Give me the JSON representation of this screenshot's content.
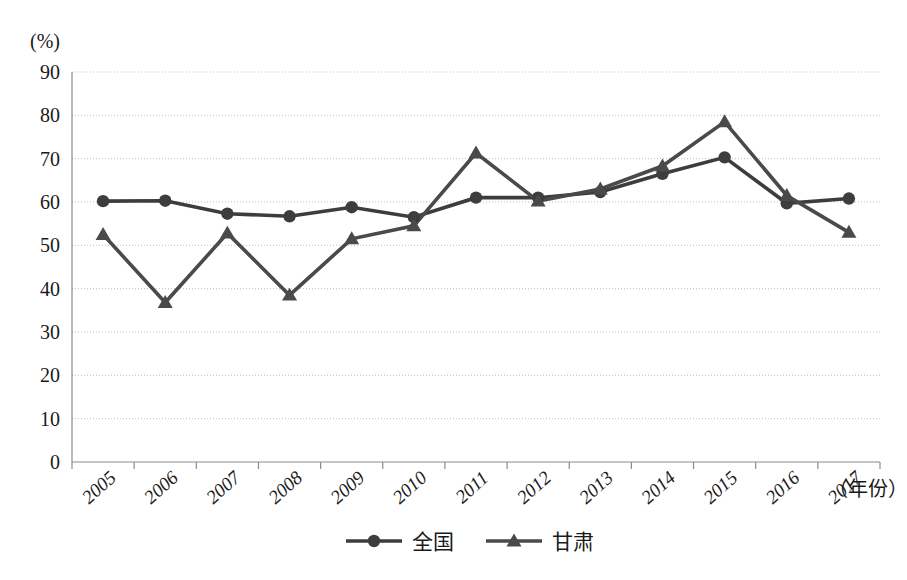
{
  "chart_data": {
    "type": "line",
    "title": "",
    "subtitle": "",
    "xlabel": "（年份）",
    "ylabel": "(%)",
    "ylim": [
      0,
      90
    ],
    "ytick_step": 10,
    "yticks": [
      "0",
      "10",
      "20",
      "30",
      "40",
      "50",
      "60",
      "70",
      "80",
      "90"
    ],
    "grid": true,
    "legend_position": "bottom-center",
    "categories": [
      "2005",
      "2006",
      "2007",
      "2008",
      "2009",
      "2010",
      "2011",
      "2012",
      "2013",
      "2014",
      "2015",
      "2016",
      "2017"
    ],
    "series": [
      {
        "name": "全国",
        "marker": "circle",
        "color": "#3d3d3d",
        "values": [
          60.2,
          60.3,
          57.3,
          56.7,
          58.8,
          56.5,
          61.0,
          61.0,
          62.3,
          66.5,
          70.3,
          59.7,
          60.8
        ]
      },
      {
        "name": "甘肃",
        "marker": "triangle",
        "color": "#4a4a4a",
        "values": [
          52.5,
          36.8,
          52.8,
          38.5,
          51.5,
          54.5,
          71.3,
          60.2,
          63.0,
          68.3,
          78.5,
          61.5,
          53.0
        ]
      }
    ]
  },
  "axis": {
    "y_unit_label": "(%)",
    "x_axis_title": "（年份）"
  },
  "legend": {
    "items": [
      {
        "label": "全国",
        "marker": "circle"
      },
      {
        "label": "甘肃",
        "marker": "triangle"
      }
    ]
  },
  "colors": {
    "series_primary": "#3d3d3d",
    "series_secondary": "#4a4a4a",
    "gridline": "#bdbdbd",
    "axis": "#8c8c8c",
    "background": "#ffffff"
  }
}
